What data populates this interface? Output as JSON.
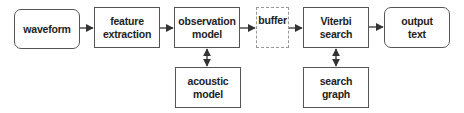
{
  "diagram": {
    "nodes": [
      {
        "id": "waveform",
        "label": "waveform",
        "shape": "rounded"
      },
      {
        "id": "feature_extraction",
        "label": "feature\nextraction",
        "shape": "rect"
      },
      {
        "id": "observation_model",
        "label": "observation\nmodel",
        "shape": "rect"
      },
      {
        "id": "acoustic_model",
        "label": "acoustic\nmodel",
        "shape": "rect"
      },
      {
        "id": "buffer",
        "label": "buffer",
        "shape": "dashed"
      },
      {
        "id": "viterbi_search",
        "label": "Viterbi\nsearch",
        "shape": "rect"
      },
      {
        "id": "search_graph",
        "label": "search\ngraph",
        "shape": "rect"
      },
      {
        "id": "output_text",
        "label": "output\ntext",
        "shape": "rounded"
      }
    ],
    "edges": [
      {
        "from": "waveform",
        "to": "feature_extraction",
        "type": "arrow"
      },
      {
        "from": "feature_extraction",
        "to": "observation_model",
        "type": "arrow"
      },
      {
        "from": "observation_model",
        "to": "buffer",
        "type": "arrow"
      },
      {
        "from": "buffer",
        "to": "viterbi_search",
        "type": "arrow"
      },
      {
        "from": "viterbi_search",
        "to": "output_text",
        "type": "arrow"
      },
      {
        "from": "observation_model",
        "to": "acoustic_model",
        "type": "bidirectional"
      },
      {
        "from": "viterbi_search",
        "to": "search_graph",
        "type": "bidirectional"
      }
    ],
    "colors": {
      "border": "#555555",
      "dashed_border": "#999999",
      "arrow": "#333333",
      "text": "#222222"
    }
  }
}
